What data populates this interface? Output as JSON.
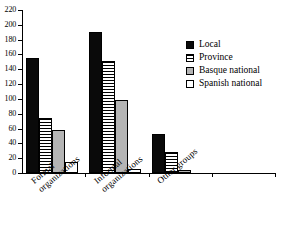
{
  "chart_data": {
    "type": "bar",
    "title": "",
    "subtitle": "",
    "xlabel": "",
    "ylabel": "",
    "ylim": [
      0,
      220
    ],
    "ytick_step": 20,
    "yticks": [
      0,
      20,
      40,
      60,
      80,
      100,
      120,
      140,
      160,
      180,
      200,
      220
    ],
    "grid": false,
    "legend_position": "right",
    "categories": [
      "Formal organizations",
      "Informal organizations",
      "Other groups"
    ],
    "category_lines": [
      [
        "Formal",
        "organizations"
      ],
      [
        "Informal",
        "organizations"
      ],
      [
        "Other groups",
        ""
      ]
    ],
    "series": [
      {
        "name": "Local",
        "values": [
          155,
          190,
          53
        ],
        "fill": "solid-black",
        "color": "#0a0a0a"
      },
      {
        "name": "Province",
        "values": [
          74,
          151,
          28
        ],
        "fill": "horizontal-lines",
        "color": "#ffffff"
      },
      {
        "name": "Basque national",
        "values": [
          58,
          98,
          4
        ],
        "fill": "solid-gray",
        "color": "#b4b4b4"
      },
      {
        "name": "Spanish national",
        "values": [
          15,
          5,
          0
        ],
        "fill": "solid-white",
        "color": "#ffffff"
      }
    ]
  },
  "legend": {
    "items": [
      {
        "label": "Local"
      },
      {
        "label": "Province"
      },
      {
        "label": "Basque national"
      },
      {
        "label": "Spanish national"
      }
    ]
  }
}
